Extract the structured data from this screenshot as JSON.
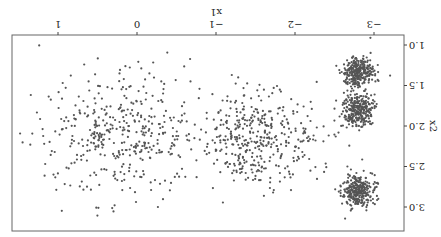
{
  "chart_data": {
    "type": "scatter",
    "title": "",
    "xlabel": "x1",
    "ylabel": "x2",
    "xlim": [
      -3.4,
      1.6
    ],
    "ylim": [
      0.8,
      3.25
    ],
    "x_ticks": [
      -3,
      -2,
      -1,
      0,
      1
    ],
    "x_tick_labels": [
      "−3",
      "−2",
      "−1",
      "0",
      "1"
    ],
    "y_ticks": [
      1.0,
      1.5,
      2.0,
      2.5,
      3.0
    ],
    "y_tick_labels": [
      "1.0",
      "1.5",
      "2.0",
      "2.5",
      "3.0"
    ],
    "grid": false,
    "legend": null,
    "orientation_note": "rendered rotated 180 degrees",
    "point_color": "#555555",
    "clusters": [
      {
        "name": "cluster-1",
        "center": [
          -2.8,
          1.33
        ],
        "std": [
          0.1,
          0.1
        ],
        "n": 300
      },
      {
        "name": "cluster-2",
        "center": [
          -2.8,
          1.8
        ],
        "std": [
          0.1,
          0.1
        ],
        "n": 300
      },
      {
        "name": "cluster-3",
        "center": [
          -2.8,
          2.8
        ],
        "std": [
          0.1,
          0.1
        ],
        "n": 300
      },
      {
        "name": "cluster-4",
        "center": [
          -1.5,
          2.17
        ],
        "std": [
          0.38,
          0.3
        ],
        "n": 400
      },
      {
        "name": "cluster-5",
        "center": [
          0.2,
          2.1
        ],
        "std": [
          0.5,
          0.38
        ],
        "n": 420
      }
    ]
  }
}
